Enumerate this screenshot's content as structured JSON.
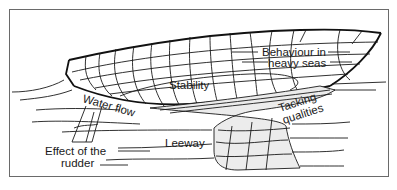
{
  "diagram": {
    "labels": {
      "behaviour": [
        "Behaviour in",
        "heavy seas"
      ],
      "stability": "Stability",
      "water_flow": "Water flow",
      "tacking": [
        "Tacking",
        "qualities"
      ],
      "rudder": [
        "Effect of the",
        "rudder"
      ],
      "leeway": "Leeway"
    },
    "colors": {
      "line": "#1a1a1a",
      "shade": "#ececec",
      "frame": "#6a6a6a"
    }
  }
}
